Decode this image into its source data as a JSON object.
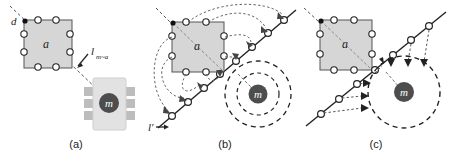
{
  "figure": {
    "background": "#ffffff",
    "width": 456,
    "height": 152
  },
  "style": {
    "square_fill": "#d6d6d6",
    "square_stroke": "#555555",
    "node_fill": "#ffffff",
    "node_stroke": "#222222",
    "seed_fill": "#111111",
    "line_stroke": "#222222",
    "dotted_stroke": "#666666",
    "dashed_stroke": "#222222",
    "m_circle_fill": "#4d4d4d",
    "m_text_color": "#ffffff",
    "chip_fill": "#e2e2e2",
    "chip_pin_fill": "#bdbdbd",
    "text_color": "#222222"
  },
  "panels": [
    {
      "id": "a",
      "caption": "(a)",
      "labels": {
        "seed": "d",
        "diagonal": "a",
        "distance": "l",
        "distance_sub": "m~a",
        "node": "m"
      },
      "description": "Lattice square with seed node d, diagonal a, dashed ray to chip node m annotated with l_m~a"
    },
    {
      "id": "b",
      "caption": "(b)",
      "labels": {
        "diagonal": "a",
        "line": "l'",
        "node": "m"
      },
      "description": "Lattice nodes mapped by curved dotted arrows onto a straight diagonal line l' of circles; m sits inside two concentric dashed circles"
    },
    {
      "id": "c",
      "caption": "(c)",
      "labels": {
        "diagonal": "a",
        "node": "m"
      },
      "description": "Straight dotted arrows from line nodes converge into dashed circle around node m"
    }
  ],
  "lattice": {
    "node_count": 8,
    "arrangement": "3x3 grid without center"
  },
  "line_nodes": {
    "panel_b_count": 8,
    "panel_c_count": 8
  }
}
